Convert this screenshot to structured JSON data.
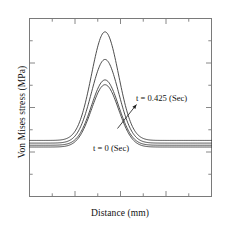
{
  "figure": {
    "background_color": "#ffffff",
    "frame_color": "#7a7a7a",
    "curve_color": "#3a3a3a"
  },
  "axes": {
    "y_title": "Von Mises stress (MPa)",
    "x_title": "Distance (mm)",
    "tick_direction": "inward",
    "tick_labels_shown": false,
    "frame_sides": [
      "top",
      "right",
      "bottom",
      "left"
    ]
  },
  "annotations": [
    {
      "id": "late",
      "text": "t = 0.425 (Sec)",
      "has_arrow": true,
      "arrow_points_to": "tallest-curve-right-flank"
    },
    {
      "id": "initial",
      "text": "t = 0 (Sec)",
      "has_arrow": false,
      "arrow_points_to": "lowest-curve-baseline"
    }
  ],
  "chart_data": {
    "type": "line",
    "title": "",
    "subtitle": "",
    "xlabel": "Distance (mm)",
    "ylabel": "Von Mises stress (MPa)",
    "xlim": [
      0,
      1
    ],
    "ylim": [
      0,
      1
    ],
    "grid": false,
    "legend_position": "none",
    "tick_labels": {
      "x": [],
      "y": []
    },
    "x_major_ticks": [
      0.0,
      0.25,
      0.5,
      0.75,
      1.0
    ],
    "x_minor_ticks": [
      0.125,
      0.375,
      0.625,
      0.875
    ],
    "y_major_ticks": [
      0.0,
      0.25,
      0.5,
      0.75,
      1.0
    ],
    "y_minor_ticks": [
      0.125,
      0.375,
      0.625,
      0.875
    ],
    "peak_center": 0.415,
    "peak_width": 0.105,
    "series": [
      {
        "name": "t = 0.425 (Sec)",
        "baseline": 0.315,
        "peak": 0.925,
        "amplitude": 0.61
      },
      {
        "name": "t = 0.283 (Sec)",
        "baseline": 0.3,
        "peak": 0.77,
        "amplitude": 0.47
      },
      {
        "name": "t = 0.142 (Sec)",
        "baseline": 0.288,
        "peak": 0.655,
        "amplitude": 0.367
      },
      {
        "name": "t = 0 (Sec)",
        "baseline": 0.278,
        "peak": 0.628,
        "amplitude": 0.35
      }
    ]
  }
}
